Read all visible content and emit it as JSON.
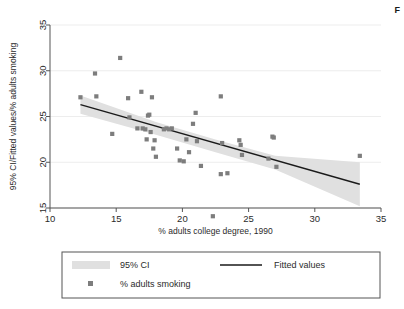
{
  "figure": {
    "corner_letter": "F",
    "background_color": "#ffffff"
  },
  "chart_data": {
    "type": "scatter",
    "title": "",
    "subtitle": "",
    "xlabel": "% adults college degree, 1990",
    "ylabel": "95% CI/Fitted values/% adults smoking",
    "xlim": [
      10,
      35
    ],
    "ylim": [
      13,
      35
    ],
    "xticks": [
      10,
      15,
      20,
      25,
      30,
      35
    ],
    "yticks": [
      15,
      20,
      25,
      30,
      35
    ],
    "grid": "horizontal",
    "grid_color": "#e8e8e8",
    "marker_color": "#7d7d7d",
    "line_color": "#1a1a1a",
    "band_color": "#e0e0e0",
    "legend_position": "below-plot",
    "legend": [
      {
        "key": "ci",
        "label": "95% CI",
        "style": "band"
      },
      {
        "key": "fit",
        "label": "Fitted values",
        "style": "line"
      },
      {
        "key": "points",
        "label": "% adults smoking",
        "style": "marker"
      }
    ],
    "series": [
      {
        "name": "% adults smoking",
        "type": "scatter",
        "points": [
          [
            12.3,
            27.1
          ],
          [
            13.4,
            29.7
          ],
          [
            13.5,
            27.2
          ],
          [
            14.7,
            23.1
          ],
          [
            15.3,
            31.4
          ],
          [
            15.9,
            27.0
          ],
          [
            16.0,
            24.9
          ],
          [
            16.6,
            23.7
          ],
          [
            16.9,
            27.7
          ],
          [
            17.0,
            23.7
          ],
          [
            17.2,
            23.6
          ],
          [
            17.3,
            22.5
          ],
          [
            17.4,
            25.1
          ],
          [
            17.5,
            25.2
          ],
          [
            17.6,
            23.3
          ],
          [
            17.7,
            27.1
          ],
          [
            17.8,
            21.5
          ],
          [
            17.9,
            22.4
          ],
          [
            18.0,
            20.6
          ],
          [
            18.6,
            23.6
          ],
          [
            18.8,
            23.7
          ],
          [
            19.0,
            23.6
          ],
          [
            19.2,
            23.7
          ],
          [
            19.6,
            21.5
          ],
          [
            19.8,
            20.2
          ],
          [
            20.1,
            20.1
          ],
          [
            20.3,
            22.5
          ],
          [
            20.5,
            21.1
          ],
          [
            20.8,
            24.2
          ],
          [
            21.0,
            25.4
          ],
          [
            21.1,
            22.3
          ],
          [
            21.4,
            19.6
          ],
          [
            22.3,
            14.1
          ],
          [
            22.9,
            27.2
          ],
          [
            22.9,
            18.7
          ],
          [
            23.0,
            22.1
          ],
          [
            23.4,
            18.8
          ],
          [
            24.3,
            22.4
          ],
          [
            24.4,
            21.9
          ],
          [
            24.5,
            20.8
          ],
          [
            26.5,
            20.4
          ],
          [
            26.8,
            22.8
          ],
          [
            26.9,
            22.7
          ],
          [
            27.1,
            19.5
          ],
          [
            33.4,
            20.7
          ]
        ]
      },
      {
        "name": "Fitted values",
        "type": "line",
        "points": [
          [
            12.3,
            26.3
          ],
          [
            33.4,
            17.6
          ]
        ]
      },
      {
        "name": "95% CI",
        "type": "band",
        "lower": [
          [
            12.3,
            25.3
          ],
          [
            18.0,
            23.0
          ],
          [
            22.5,
            21.1
          ],
          [
            27.0,
            19.2
          ],
          [
            33.4,
            15.2
          ]
        ],
        "upper": [
          [
            12.3,
            27.3
          ],
          [
            18.0,
            24.4
          ],
          [
            22.5,
            22.5
          ],
          [
            27.0,
            20.7
          ],
          [
            33.4,
            20.0
          ]
        ]
      }
    ]
  }
}
